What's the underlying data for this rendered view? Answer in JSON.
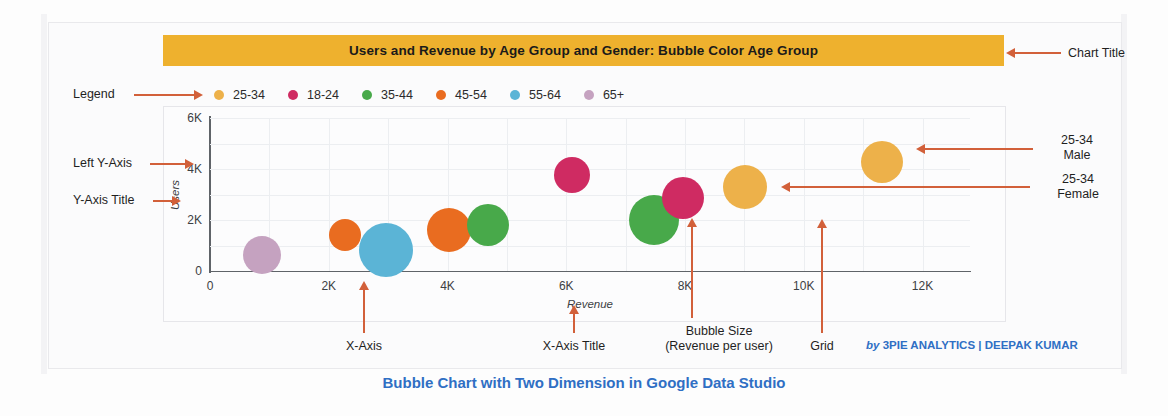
{
  "chart_data": {
    "type": "scatter",
    "title": "Users and Revenue by Age Group and Gender: Bubble Color Age Group",
    "xlabel": "Revenue",
    "ylabel": "Users",
    "xlim": [
      0,
      12800
    ],
    "ylim": [
      0,
      6000
    ],
    "xticks": [
      "0",
      "2K",
      "4K",
      "6K",
      "8K",
      "10K",
      "12K"
    ],
    "xtick_values": [
      0,
      2000,
      4000,
      6000,
      8000,
      10000,
      12000
    ],
    "yticks": [
      "0",
      "2K",
      "4K",
      "6K"
    ],
    "ytick_values": [
      0,
      2000,
      4000,
      6000
    ],
    "grid": true,
    "legend_position": "top",
    "size_meaning": "Revenue per user",
    "legend": [
      {
        "label": "25-34",
        "color": "#edb14a"
      },
      {
        "label": "18-24",
        "color": "#cf2b62"
      },
      {
        "label": "35-44",
        "color": "#48a94a"
      },
      {
        "label": "45-54",
        "color": "#e96c20"
      },
      {
        "label": "55-64",
        "color": "#5bb4d6"
      },
      {
        "label": "65+",
        "color": "#c5a2c0"
      }
    ],
    "points": [
      {
        "label": "65+",
        "x": 880,
        "y": 620,
        "r": 19,
        "color": "#c5a2c0"
      },
      {
        "label": "45-54",
        "x": 2270,
        "y": 1400,
        "r": 16,
        "color": "#e96c20"
      },
      {
        "label": "55-64",
        "x": 2960,
        "y": 840,
        "r": 27,
        "color": "#5bb4d6"
      },
      {
        "label": "45-54",
        "x": 4020,
        "y": 1600,
        "r": 22,
        "color": "#e96c20"
      },
      {
        "label": "35-44",
        "x": 4680,
        "y": 1800,
        "r": 21,
        "color": "#48a94a"
      },
      {
        "label": "18-24",
        "x": 6100,
        "y": 3780,
        "r": 18,
        "color": "#cf2b62"
      },
      {
        "label": "35-44",
        "x": 7480,
        "y": 2000,
        "r": 25,
        "color": "#48a94a"
      },
      {
        "label": "18-24",
        "x": 7960,
        "y": 2850,
        "r": 21,
        "color": "#cf2b62"
      },
      {
        "label": "25-34 Female",
        "x": 9010,
        "y": 3300,
        "r": 22,
        "color": "#edb14a"
      },
      {
        "label": "25-34 Male",
        "x": 11320,
        "y": 4270,
        "r": 21,
        "color": "#edb14a"
      }
    ]
  },
  "annotations": {
    "legend": "Legend",
    "left_y_axis": "Left Y-Axis",
    "y_axis_title": "Y-Axis Title",
    "chart_title": "Chart Title",
    "male_line1": "25-34",
    "male_line2": "Male",
    "female_line1": "25-34",
    "female_line2": "Female",
    "x_axis": "X-Axis",
    "x_axis_title": "X-Axis Title",
    "bubble_size_line1": "Bubble Size",
    "bubble_size_line2": "(Revenue per user)",
    "grid": "Grid"
  },
  "credit": {
    "by": "by ",
    "name": "3PIE ANALYTICS | DEEPAK KUMAR"
  },
  "caption": "Bubble Chart with Two Dimension in Google Data Studio",
  "colors": {
    "title_bar": "#eeb12e",
    "arrow": "#d2603a",
    "caption": "#2f6fc4"
  }
}
